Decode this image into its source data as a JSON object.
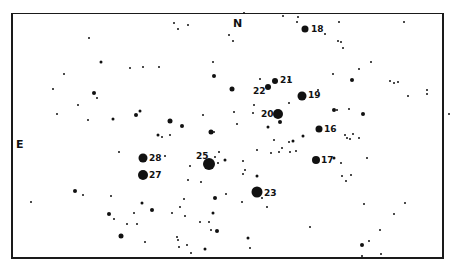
{
  "chart": {
    "directions": [
      {
        "label": "N",
        "x": 233,
        "y": 18
      },
      {
        "label": "E",
        "x": 16,
        "y": 139
      }
    ],
    "labeled_stars": [
      {
        "id": "18",
        "x": 305,
        "y": 29,
        "size": 7
      },
      {
        "id": "21",
        "x": 275,
        "y": 81,
        "size": 6
      },
      {
        "id": "22",
        "x": 268,
        "y": 87,
        "size": 6
      },
      {
        "id": "19",
        "x": 302,
        "y": 96,
        "size": 9
      },
      {
        "id": "20",
        "x": 278,
        "y": 114,
        "size": 10
      },
      {
        "id": "16",
        "x": 319,
        "y": 129,
        "size": 7
      },
      {
        "id": "17",
        "x": 316,
        "y": 160,
        "size": 8
      },
      {
        "id": "23",
        "x": 257,
        "y": 192,
        "size": 11
      },
      {
        "id": "25",
        "x": 209,
        "y": 164,
        "size": 12
      },
      {
        "id": "28",
        "x": 143,
        "y": 158,
        "size": 9
      },
      {
        "id": "27",
        "x": 143,
        "y": 175,
        "size": 10
      }
    ],
    "label_positions": [
      {
        "id": "18",
        "x": 311,
        "y": 29
      },
      {
        "id": "21",
        "x": 280,
        "y": 80
      },
      {
        "id": "22",
        "x": 253,
        "y": 91
      },
      {
        "id": "19",
        "x": 308,
        "y": 95
      },
      {
        "id": "20",
        "x": 261,
        "y": 114
      },
      {
        "id": "16",
        "x": 324,
        "y": 129
      },
      {
        "id": "17",
        "x": 321,
        "y": 160
      },
      {
        "id": "23",
        "x": 264,
        "y": 193
      },
      {
        "id": "25",
        "x": 196,
        "y": 156
      },
      {
        "id": "28",
        "x": 149,
        "y": 158
      },
      {
        "id": "27",
        "x": 149,
        "y": 175
      }
    ],
    "field_stars": [
      [
        174,
        23,
        2
      ],
      [
        178,
        29,
        2
      ],
      [
        188,
        25,
        2
      ],
      [
        89,
        38,
        2
      ],
      [
        101,
        62,
        3
      ],
      [
        130,
        68,
        2
      ],
      [
        143,
        67,
        2
      ],
      [
        159,
        67,
        2
      ],
      [
        64,
        74,
        2
      ],
      [
        53,
        89,
        2
      ],
      [
        94,
        93,
        4
      ],
      [
        97,
        98,
        2
      ],
      [
        78,
        105,
        2
      ],
      [
        57,
        114,
        2
      ],
      [
        88,
        120,
        2
      ],
      [
        113,
        119,
        3
      ],
      [
        136,
        115,
        4
      ],
      [
        140,
        111,
        3
      ],
      [
        170,
        121,
        5
      ],
      [
        182,
        126,
        4
      ],
      [
        203,
        115,
        2
      ],
      [
        211,
        132,
        5
      ],
      [
        214,
        132,
        2
      ],
      [
        158,
        135,
        3
      ],
      [
        162,
        137,
        2
      ],
      [
        170,
        135,
        2
      ],
      [
        213,
        62,
        2
      ],
      [
        214,
        76,
        4
      ],
      [
        232,
        89,
        5
      ],
      [
        244,
        13,
        2
      ],
      [
        229,
        35,
        2
      ],
      [
        233,
        41,
        2
      ],
      [
        283,
        16,
        2
      ],
      [
        298,
        17,
        2
      ],
      [
        297,
        22,
        2
      ],
      [
        339,
        22,
        2
      ],
      [
        325,
        34,
        2
      ],
      [
        338,
        41,
        2
      ],
      [
        341,
        42,
        2
      ],
      [
        343,
        48,
        2
      ],
      [
        371,
        62,
        2
      ],
      [
        359,
        69,
        2
      ],
      [
        333,
        74,
        2
      ],
      [
        352,
        80,
        4
      ],
      [
        390,
        81,
        2
      ],
      [
        394,
        83,
        2
      ],
      [
        398,
        82,
        2
      ],
      [
        408,
        96,
        2
      ],
      [
        318,
        90,
        2
      ],
      [
        289,
        103,
        2
      ],
      [
        289,
        80,
        2
      ],
      [
        260,
        79,
        2
      ],
      [
        254,
        105,
        2
      ],
      [
        234,
        112,
        2
      ],
      [
        237,
        124,
        2
      ],
      [
        253,
        113,
        2
      ],
      [
        268,
        127,
        3
      ],
      [
        280,
        122,
        4
      ],
      [
        289,
        142,
        2
      ],
      [
        337,
        110,
        2
      ],
      [
        334,
        110,
        4
      ],
      [
        349,
        109,
        2
      ],
      [
        363,
        114,
        4
      ],
      [
        345,
        135,
        2
      ],
      [
        350,
        139,
        2
      ],
      [
        353,
        134,
        2
      ],
      [
        359,
        138,
        2
      ],
      [
        347,
        138,
        2
      ],
      [
        303,
        136,
        3
      ],
      [
        274,
        140,
        2
      ],
      [
        257,
        150,
        2
      ],
      [
        271,
        153,
        2
      ],
      [
        282,
        148,
        2
      ],
      [
        225,
        160,
        3
      ],
      [
        219,
        152,
        2
      ],
      [
        218,
        163,
        2
      ],
      [
        215,
        157,
        2
      ],
      [
        243,
        174,
        2
      ],
      [
        257,
        176,
        3
      ],
      [
        245,
        170,
        2
      ],
      [
        243,
        161,
        2
      ],
      [
        293,
        141,
        3
      ],
      [
        367,
        158,
        2
      ],
      [
        334,
        158,
        3
      ],
      [
        341,
        163,
        2
      ],
      [
        342,
        176,
        2
      ],
      [
        346,
        181,
        2
      ],
      [
        351,
        175,
        2
      ],
      [
        364,
        204,
        2
      ],
      [
        394,
        214,
        2
      ],
      [
        405,
        203,
        2
      ],
      [
        226,
        194,
        2
      ],
      [
        242,
        202,
        2
      ],
      [
        248,
        238,
        3
      ],
      [
        250,
        248,
        2
      ],
      [
        262,
        198,
        2
      ],
      [
        267,
        207,
        2
      ],
      [
        279,
        152,
        2
      ],
      [
        290,
        152,
        2
      ],
      [
        296,
        151,
        2
      ],
      [
        200,
        222,
        2
      ],
      [
        185,
        216,
        2
      ],
      [
        201,
        182,
        2
      ],
      [
        215,
        198,
        4
      ],
      [
        213,
        213,
        3
      ],
      [
        217,
        231,
        4
      ],
      [
        211,
        230,
        2
      ],
      [
        209,
        222,
        2
      ],
      [
        205,
        249,
        3
      ],
      [
        191,
        253,
        2
      ],
      [
        187,
        245,
        2
      ],
      [
        179,
        247,
        2
      ],
      [
        177,
        237,
        2
      ],
      [
        178,
        240,
        2
      ],
      [
        180,
        207,
        2
      ],
      [
        184,
        199,
        2
      ],
      [
        172,
        213,
        2
      ],
      [
        165,
        156,
        2
      ],
      [
        190,
        166,
        2
      ],
      [
        188,
        180,
        2
      ],
      [
        142,
        203,
        3
      ],
      [
        152,
        210,
        4
      ],
      [
        137,
        224,
        2
      ],
      [
        127,
        224,
        2
      ],
      [
        134,
        213,
        2
      ],
      [
        109,
        214,
        4
      ],
      [
        114,
        219,
        2
      ],
      [
        121,
        236,
        5
      ],
      [
        145,
        242,
        2
      ],
      [
        111,
        196,
        2
      ],
      [
        75,
        191,
        4
      ],
      [
        83,
        195,
        2
      ],
      [
        31,
        202,
        2
      ],
      [
        119,
        152,
        2
      ],
      [
        362,
        245,
        4
      ],
      [
        369,
        241,
        2
      ],
      [
        380,
        230,
        2
      ],
      [
        362,
        256,
        2
      ],
      [
        381,
        254,
        2
      ],
      [
        310,
        227,
        2
      ],
      [
        404,
        22,
        2
      ],
      [
        427,
        94,
        2
      ],
      [
        427,
        90,
        2
      ],
      [
        449,
        114,
        2
      ]
    ]
  }
}
